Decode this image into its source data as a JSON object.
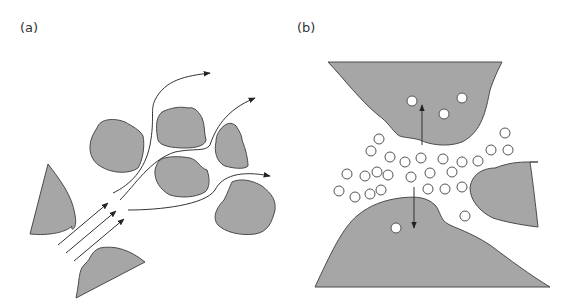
{
  "figure": {
    "panels": [
      {
        "id": "a",
        "label": "(a)",
        "description": "flow lines through gaps between grains"
      },
      {
        "id": "b",
        "label": "(b)",
        "description": "particles in pore space between grains; arrows indicate motion into grains"
      }
    ]
  },
  "colors": {
    "grain_fill": "#a6a6a6",
    "grain_stroke": "#4a4a4a",
    "line": "#333333",
    "particle_fill": "#ffffff",
    "background": "#ffffff"
  },
  "panel_b": {
    "particles_in_pore_count": 31,
    "particles_in_grains_count": 4
  }
}
